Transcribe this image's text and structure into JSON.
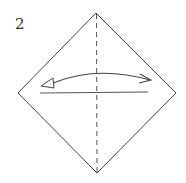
{
  "diagram": {
    "step_number": "2",
    "type": "origami-fold-instruction",
    "shape": "square-on-diagonal",
    "elements": {
      "outline": {
        "points": [
          [
            96,
            13
          ],
          [
            176,
            93
          ],
          [
            97,
            173
          ],
          [
            18,
            93
          ]
        ],
        "color": "#444444"
      },
      "vertical_crease": {
        "style": "dashed",
        "from": [
          96,
          14
        ],
        "to": [
          97,
          172
        ]
      },
      "horizontal_line": {
        "from": [
          40,
          93
        ],
        "to": [
          148,
          92
        ]
      },
      "fold_arrow": {
        "style": "double-ended-arc",
        "left_head": "hollow-triangle",
        "right_head": "open-arrow"
      }
    }
  }
}
